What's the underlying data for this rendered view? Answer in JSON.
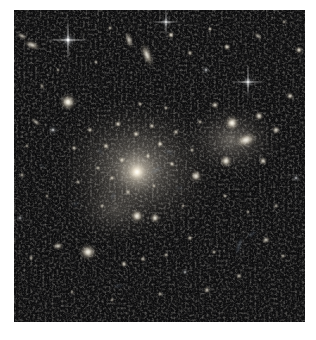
{
  "image": {
    "kind": "astronomical-observation",
    "subject": "galaxy-cluster",
    "alt_text": "Deep-field astronomical image of a rich galaxy cluster: hundreds of yellow-white elliptical galaxies concentrated toward a bright diffuse core, with faint blue gravitationally lensed arcs, edge-on spirals and foreground stars on a black background."
  },
  "canvas": {
    "width": 316,
    "height": 340,
    "margin_color": "#ffffff",
    "field": {
      "x": 14,
      "y": 10,
      "width": 291,
      "height": 312
    },
    "field_background": "#010101"
  },
  "palette": {
    "background": "#000000",
    "margin": "#ffffff",
    "core_glow": "#cfc7b8",
    "galaxy_core": "#fffdf6",
    "galaxy_halo": "#b7ad9a",
    "arc_blue": "#9fb9d8",
    "star_white": "#ffffff",
    "faint_noise": "#141414"
  },
  "field_content": {
    "diffuse_halo": {
      "label": "intracluster-light",
      "center_x": 137,
      "center_y": 168,
      "radius_x": 92,
      "radius_y": 80,
      "peak_opacity": 0.55
    },
    "secondary_halo": {
      "label": "subcluster-light",
      "center_x": 232,
      "center_y": 140,
      "radius_x": 56,
      "radius_y": 42,
      "peak_opacity": 0.4
    },
    "brightest_cluster_galaxy": {
      "x": 137,
      "y": 172,
      "radius": 13,
      "peak": 1.0
    },
    "galaxies": [
      {
        "x": 68,
        "y": 102,
        "r": 10.5,
        "b": 0.96,
        "e": 1.0,
        "a": 0
      },
      {
        "x": 232,
        "y": 123,
        "r": 9.5,
        "b": 0.95,
        "e": 1.0,
        "a": 0
      },
      {
        "x": 246,
        "y": 140,
        "r": 9.0,
        "b": 0.9,
        "e": 1.55,
        "a": -18
      },
      {
        "x": 88,
        "y": 252,
        "r": 10.0,
        "b": 0.92,
        "e": 1.1,
        "a": 10
      },
      {
        "x": 226,
        "y": 161,
        "r": 8.0,
        "b": 0.88,
        "e": 1.0,
        "a": 0
      },
      {
        "x": 137,
        "y": 216,
        "r": 8.5,
        "b": 0.9,
        "e": 1.0,
        "a": 0
      },
      {
        "x": 155,
        "y": 218,
        "r": 6.5,
        "b": 0.82,
        "e": 1.0,
        "a": 0
      },
      {
        "x": 196,
        "y": 176,
        "r": 7.5,
        "b": 0.86,
        "e": 1.0,
        "a": 0
      },
      {
        "x": 259,
        "y": 116,
        "r": 6.0,
        "b": 0.8,
        "e": 1.0,
        "a": 0
      },
      {
        "x": 276,
        "y": 130,
        "r": 5.5,
        "b": 0.76,
        "e": 1.0,
        "a": 0
      },
      {
        "x": 215,
        "y": 105,
        "r": 5.0,
        "b": 0.74,
        "e": 1.0,
        "a": 0
      },
      {
        "x": 263,
        "y": 161,
        "r": 5.5,
        "b": 0.76,
        "e": 1.0,
        "a": 0
      },
      {
        "x": 290,
        "y": 96,
        "r": 5.0,
        "b": 0.74,
        "e": 1.0,
        "a": 0
      },
      {
        "x": 299,
        "y": 50,
        "r": 5.0,
        "b": 0.8,
        "e": 1.0,
        "a": 0
      },
      {
        "x": 227,
        "y": 47,
        "r": 4.5,
        "b": 0.78,
        "e": 1.0,
        "a": 0
      },
      {
        "x": 171,
        "y": 35,
        "r": 4.5,
        "b": 0.8,
        "e": 1.0,
        "a": 0
      },
      {
        "x": 147,
        "y": 55,
        "r": 6.5,
        "b": 0.82,
        "e": 2.3,
        "a": 68
      },
      {
        "x": 129,
        "y": 40,
        "r": 5.0,
        "b": 0.72,
        "e": 2.1,
        "a": 75
      },
      {
        "x": 32,
        "y": 45,
        "r": 5.5,
        "b": 0.78,
        "e": 1.9,
        "a": 20
      },
      {
        "x": 22,
        "y": 36,
        "r": 4.0,
        "b": 0.66,
        "e": 1.7,
        "a": 25
      },
      {
        "x": 190,
        "y": 53,
        "r": 4.0,
        "b": 0.68,
        "e": 1.0,
        "a": 0
      },
      {
        "x": 210,
        "y": 29,
        "r": 3.5,
        "b": 0.66,
        "e": 1.0,
        "a": 0
      },
      {
        "x": 258,
        "y": 36,
        "r": 3.5,
        "b": 0.62,
        "e": 1.8,
        "a": 40
      },
      {
        "x": 284,
        "y": 22,
        "r": 3.0,
        "b": 0.58,
        "e": 1.0,
        "a": 0
      },
      {
        "x": 110,
        "y": 28,
        "r": 3.5,
        "b": 0.6,
        "e": 1.0,
        "a": 0
      },
      {
        "x": 96,
        "y": 62,
        "r": 3.0,
        "b": 0.58,
        "e": 1.0,
        "a": 0
      },
      {
        "x": 58,
        "y": 70,
        "r": 3.0,
        "b": 0.56,
        "e": 1.0,
        "a": 0
      },
      {
        "x": 42,
        "y": 86,
        "r": 3.0,
        "b": 0.58,
        "e": 1.6,
        "a": 60
      },
      {
        "x": 36,
        "y": 122,
        "r": 3.5,
        "b": 0.6,
        "e": 2.2,
        "a": 35
      },
      {
        "x": 27,
        "y": 146,
        "r": 3.0,
        "b": 0.56,
        "e": 1.0,
        "a": 0
      },
      {
        "x": 22,
        "y": 175,
        "r": 3.5,
        "b": 0.6,
        "e": 1.0,
        "a": 0
      },
      {
        "x": 47,
        "y": 196,
        "r": 3.0,
        "b": 0.58,
        "e": 1.0,
        "a": 0
      },
      {
        "x": 58,
        "y": 246,
        "r": 5.0,
        "b": 0.72,
        "e": 1.4,
        "a": 0
      },
      {
        "x": 31,
        "y": 258,
        "r": 3.5,
        "b": 0.62,
        "e": 1.0,
        "a": 0
      },
      {
        "x": 124,
        "y": 264,
        "r": 4.5,
        "b": 0.7,
        "e": 1.0,
        "a": 0
      },
      {
        "x": 143,
        "y": 259,
        "r": 4.0,
        "b": 0.66,
        "e": 1.0,
        "a": 0
      },
      {
        "x": 166,
        "y": 255,
        "r": 3.5,
        "b": 0.62,
        "e": 1.0,
        "a": 0
      },
      {
        "x": 190,
        "y": 238,
        "r": 4.0,
        "b": 0.66,
        "e": 1.0,
        "a": 0
      },
      {
        "x": 214,
        "y": 252,
        "r": 3.5,
        "b": 0.6,
        "e": 1.0,
        "a": 0
      },
      {
        "x": 239,
        "y": 276,
        "r": 4.0,
        "b": 0.64,
        "e": 1.0,
        "a": 0
      },
      {
        "x": 207,
        "y": 290,
        "r": 4.5,
        "b": 0.68,
        "e": 1.0,
        "a": 0
      },
      {
        "x": 160,
        "y": 294,
        "r": 3.5,
        "b": 0.6,
        "e": 1.0,
        "a": 0
      },
      {
        "x": 112,
        "y": 300,
        "r": 3.0,
        "b": 0.56,
        "e": 1.0,
        "a": 0
      },
      {
        "x": 72,
        "y": 292,
        "r": 3.0,
        "b": 0.54,
        "e": 1.0,
        "a": 0
      },
      {
        "x": 266,
        "y": 240,
        "r": 4.5,
        "b": 0.68,
        "e": 1.3,
        "a": -20
      },
      {
        "x": 283,
        "y": 256,
        "r": 3.5,
        "b": 0.58,
        "e": 1.0,
        "a": 0
      },
      {
        "x": 276,
        "y": 206,
        "r": 3.5,
        "b": 0.58,
        "e": 1.0,
        "a": 0
      },
      {
        "x": 248,
        "y": 212,
        "r": 3.0,
        "b": 0.54,
        "e": 1.0,
        "a": 0
      },
      {
        "x": 225,
        "y": 196,
        "r": 3.5,
        "b": 0.58,
        "e": 1.0,
        "a": 0
      },
      {
        "x": 183,
        "y": 206,
        "r": 3.0,
        "b": 0.56,
        "e": 1.0,
        "a": 0
      },
      {
        "x": 102,
        "y": 206,
        "r": 3.5,
        "b": 0.6,
        "e": 1.0,
        "a": 0
      },
      {
        "x": 78,
        "y": 182,
        "r": 3.5,
        "b": 0.62,
        "e": 1.0,
        "a": 0
      },
      {
        "x": 74,
        "y": 148,
        "r": 4.0,
        "b": 0.66,
        "e": 1.0,
        "a": 0
      },
      {
        "x": 90,
        "y": 130,
        "r": 4.0,
        "b": 0.68,
        "e": 1.0,
        "a": 0
      },
      {
        "x": 106,
        "y": 146,
        "r": 4.5,
        "b": 0.74,
        "e": 1.0,
        "a": 0
      },
      {
        "x": 118,
        "y": 124,
        "r": 4.5,
        "b": 0.76,
        "e": 1.0,
        "a": 0
      },
      {
        "x": 136,
        "y": 134,
        "r": 4.5,
        "b": 0.78,
        "e": 1.0,
        "a": 0
      },
      {
        "x": 152,
        "y": 126,
        "r": 4.0,
        "b": 0.72,
        "e": 1.0,
        "a": 0
      },
      {
        "x": 160,
        "y": 144,
        "r": 4.5,
        "b": 0.78,
        "e": 1.0,
        "a": 0
      },
      {
        "x": 148,
        "y": 156,
        "r": 4.0,
        "b": 0.74,
        "e": 1.0,
        "a": 0
      },
      {
        "x": 122,
        "y": 160,
        "r": 4.5,
        "b": 0.8,
        "e": 1.0,
        "a": 0
      },
      {
        "x": 112,
        "y": 178,
        "r": 4.0,
        "b": 0.72,
        "e": 1.0,
        "a": 0
      },
      {
        "x": 128,
        "y": 192,
        "r": 4.0,
        "b": 0.7,
        "e": 1.0,
        "a": 0
      },
      {
        "x": 154,
        "y": 186,
        "r": 3.5,
        "b": 0.66,
        "e": 1.0,
        "a": 0
      },
      {
        "x": 172,
        "y": 164,
        "r": 4.0,
        "b": 0.72,
        "e": 1.0,
        "a": 0
      },
      {
        "x": 176,
        "y": 132,
        "r": 4.0,
        "b": 0.7,
        "e": 1.0,
        "a": 0
      },
      {
        "x": 192,
        "y": 150,
        "r": 3.5,
        "b": 0.64,
        "e": 1.0,
        "a": 0
      },
      {
        "x": 98,
        "y": 168,
        "r": 3.5,
        "b": 0.66,
        "e": 1.0,
        "a": 0
      },
      {
        "x": 166,
        "y": 108,
        "r": 3.5,
        "b": 0.62,
        "e": 1.0,
        "a": 0
      },
      {
        "x": 140,
        "y": 104,
        "r": 3.5,
        "b": 0.64,
        "e": 1.0,
        "a": 0
      },
      {
        "x": 200,
        "y": 122,
        "r": 3.5,
        "b": 0.62,
        "e": 1.0,
        "a": 0
      }
    ],
    "stars": [
      {
        "x": 68,
        "y": 40,
        "r": 3.2,
        "spikes": true,
        "b": 1.0
      },
      {
        "x": 248,
        "y": 82,
        "r": 2.6,
        "spikes": true,
        "b": 0.92
      },
      {
        "x": 166,
        "y": 22,
        "r": 2.2,
        "spikes": true,
        "b": 0.88
      },
      {
        "x": 53,
        "y": 130,
        "r": 2.0,
        "spikes": false,
        "b": 0.8
      },
      {
        "x": 206,
        "y": 70,
        "r": 1.8,
        "spikes": false,
        "b": 0.74
      },
      {
        "x": 296,
        "y": 178,
        "r": 1.8,
        "spikes": false,
        "b": 0.72
      },
      {
        "x": 20,
        "y": 218,
        "r": 1.6,
        "spikes": false,
        "b": 0.68
      },
      {
        "x": 185,
        "y": 272,
        "r": 1.6,
        "spikes": false,
        "b": 0.66
      }
    ],
    "lensed_arcs": [
      {
        "x": 156,
        "y": 170,
        "len": 17,
        "thick": 2.6,
        "a": -28,
        "b": 0.6
      },
      {
        "x": 169,
        "y": 152,
        "len": 14,
        "thick": 2.2,
        "a": 22,
        "b": 0.52
      },
      {
        "x": 113,
        "y": 196,
        "len": 13,
        "thick": 2.0,
        "a": -52,
        "b": 0.5
      },
      {
        "x": 100,
        "y": 151,
        "len": 12,
        "thick": 2.0,
        "a": 62,
        "b": 0.48
      },
      {
        "x": 180,
        "y": 188,
        "len": 12,
        "thick": 2.0,
        "a": -10,
        "b": 0.46
      },
      {
        "x": 239,
        "y": 246,
        "len": 22,
        "thick": 3.0,
        "a": -72,
        "b": 0.62
      },
      {
        "x": 252,
        "y": 234,
        "len": 15,
        "thick": 2.4,
        "a": -35,
        "b": 0.52
      },
      {
        "x": 76,
        "y": 204,
        "len": 12,
        "thick": 2.0,
        "a": -40,
        "b": 0.46
      },
      {
        "x": 118,
        "y": 286,
        "len": 14,
        "thick": 2.2,
        "a": -5,
        "b": 0.48
      },
      {
        "x": 42,
        "y": 166,
        "len": 11,
        "thick": 1.8,
        "a": 35,
        "b": 0.44
      }
    ],
    "counts": {
      "galaxies_rendered": 71,
      "stars_rendered": 8,
      "arcs_rendered": 10
    }
  }
}
